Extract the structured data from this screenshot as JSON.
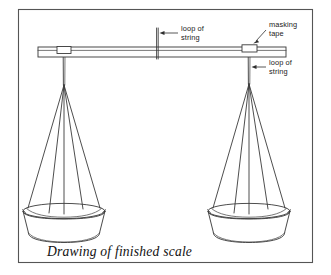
{
  "figure": {
    "title": "Drawing of finished scale",
    "caption": "Drawing of finished scale",
    "background_color": "#ffffff",
    "ink_color": "#3a3a3a",
    "frame_color": "#555555",
    "frame": {
      "x": 18,
      "y": 9,
      "width": 295,
      "height": 254
    }
  },
  "annotations": [
    {
      "id": "center-loop-of-string",
      "line1": "loop of",
      "line2": "string",
      "text_x": 181,
      "text_y": 31,
      "leader": {
        "x1": 178,
        "y1": 33,
        "x2": 161,
        "y2": 33
      },
      "points_to": "center-pivot-string"
    },
    {
      "id": "masking-tape",
      "line1": "masking",
      "line2": "tape",
      "text_x": 269,
      "text_y": 27,
      "leader": {
        "x1": 266,
        "y1": 30,
        "x2": 253,
        "y2": 43
      },
      "points_to": "right-masking-tape"
    },
    {
      "id": "right-loop-of-string",
      "line1": "loop of",
      "line2": "string",
      "text_x": 269,
      "text_y": 65,
      "leader": {
        "x1": 266,
        "y1": 67,
        "x2": 253,
        "y2": 67
      },
      "points_to": "right-hanging-string"
    }
  ],
  "parts": {
    "beam": {
      "name": "wooden beam",
      "left_x": 38,
      "right_x": 286,
      "top_y": 47,
      "bottom_y": 57
    },
    "center_string": {
      "name": "center loop of string",
      "x": 157,
      "top_y": 28,
      "bottom_y": 59
    },
    "left_tape": {
      "name": "masking tape",
      "x": 57,
      "y": 47,
      "width": 14,
      "height": 7
    },
    "right_tape": {
      "name": "masking tape",
      "x": 242,
      "y": 45,
      "width": 15,
      "height": 7
    },
    "left_assembly": {
      "name": "left pan assembly",
      "knot_x": 64,
      "knot_y": 85,
      "bowl_center_x": 64,
      "bowl_rim_y": 211,
      "bowl_rim_rx": 41,
      "bowl_rim_ry": 7.5,
      "bowl_depth": 28
    },
    "right_assembly": {
      "name": "right pan assembly",
      "knot_x": 249,
      "knot_y": 84,
      "bowl_center_x": 249,
      "bowl_rim_y": 211,
      "bowl_rim_rx": 41,
      "bowl_rim_ry": 7.5,
      "bowl_depth": 28
    }
  }
}
